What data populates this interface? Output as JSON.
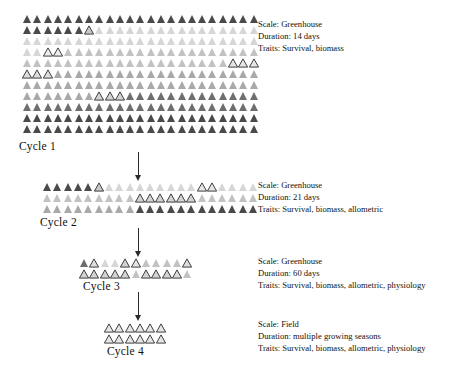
{
  "diagram": {
    "colors": {
      "shade_1": "#4a4a4a",
      "shade_2": "#6e6e6e",
      "shade_3": "#8d8d8d",
      "shade_4": "#a9a9a9",
      "shade_5": "#c2c2c2",
      "shade_6": "#d6d6d6",
      "outline": "#2b2b2b",
      "background": "#ffffff",
      "text": "#111111"
    },
    "legend_keys": [
      "Scale",
      "Duration",
      "Traits"
    ]
  },
  "cycles": [
    {
      "label": "Cycle 1",
      "info": {
        "scale": "Scale: Greenhouse",
        "duration": "Duration: 14 days",
        "traits": "Traits: Survival, biomass"
      },
      "rows": 11,
      "cols": 23,
      "grid": [
        [
          "s1",
          "s1",
          "s1",
          "s1",
          "s1",
          "s1",
          "s1",
          "s1",
          "s1",
          "s1",
          "s1",
          "s1",
          "s1",
          "s1",
          "s1",
          "s1",
          "s1",
          "s1",
          "s1",
          "s1",
          "s1",
          "s1",
          "s1"
        ],
        [
          "s1",
          "s1",
          "s1",
          "s1",
          "s1",
          "s1",
          "o1",
          "s6",
          "s6",
          "s6",
          "s6",
          "s6",
          "s6",
          "s6",
          "s6",
          "s6",
          "s6",
          "s6",
          "s6",
          "s6",
          "s6",
          "s6",
          "s6"
        ],
        [
          "s6",
          "s6",
          "s6",
          "s6",
          "s6",
          "s6",
          "s6",
          "s6",
          "s6",
          "s6",
          "s6",
          "s6",
          "s6",
          "s6",
          "s6",
          "s6",
          "s6",
          "s6",
          "s6",
          "s6",
          "s6",
          "s6",
          "s6"
        ],
        [
          "s6",
          "s6",
          "o5",
          "o5",
          "s5",
          "s5",
          "s5",
          "s5",
          "s5",
          "s5",
          "s5",
          "s5",
          "s5",
          "s5",
          "s5",
          "s5",
          "s5",
          "s5",
          "s5",
          "s5",
          "s5",
          "s5",
          "s5"
        ],
        [
          "s5",
          "s5",
          "s5",
          "s5",
          "s5",
          "s5",
          "s5",
          "s5",
          "s5",
          "s5",
          "s5",
          "s5",
          "s5",
          "s5",
          "s5",
          "s5",
          "s5",
          "s5",
          "s5",
          "s5",
          "o4",
          "o4",
          "o4"
        ],
        [
          "o3",
          "o3",
          "o3",
          "s4",
          "s4",
          "s4",
          "s4",
          "s4",
          "s4",
          "s4",
          "s4",
          "s4",
          "s4",
          "s4",
          "s4",
          "s4",
          "s4",
          "s4",
          "s4",
          "s4",
          "s4",
          "s4",
          "s4"
        ],
        [
          "s4",
          "s4",
          "s4",
          "s4",
          "s4",
          "s4",
          "s4",
          "s4",
          "s4",
          "s4",
          "s4",
          "s4",
          "s4",
          "s4",
          "s4",
          "s4",
          "s4",
          "s4",
          "s4",
          "s4",
          "s4",
          "s4",
          "s4"
        ],
        [
          "s4",
          "s4",
          "s4",
          "s4",
          "s4",
          "s4",
          "s4",
          "o2",
          "o2",
          "o2",
          "s2",
          "s2",
          "s2",
          "s2",
          "s2",
          "s2",
          "s2",
          "s2",
          "s2",
          "s2",
          "s2",
          "s2",
          "s2"
        ],
        [
          "s2",
          "s2",
          "s2",
          "s2",
          "s2",
          "s2",
          "s2",
          "s2",
          "s2",
          "s2",
          "s2",
          "s2",
          "s2",
          "s2",
          "s2",
          "s2",
          "s2",
          "s2",
          "s2",
          "s2",
          "s2",
          "s2",
          "s2"
        ],
        [
          "s1",
          "s1",
          "s1",
          "s1",
          "s1",
          "s1",
          "s1",
          "s1",
          "s1",
          "s1",
          "s1",
          "s1",
          "s1",
          "s1",
          "s1",
          "s1",
          "s1",
          "s1",
          "s1",
          "s1",
          "s1",
          "s1",
          "s1"
        ],
        [
          "s1",
          "s1",
          "s1",
          "s1",
          "s1",
          "s1",
          "s1",
          "s1",
          "s1",
          "s1",
          "s1",
          "s1",
          "s1",
          "s1",
          "s1",
          "s1",
          "s1",
          "s1",
          "s1",
          "s1",
          "s1",
          "s1",
          "s1"
        ]
      ]
    },
    {
      "label": "Cycle 2",
      "info": {
        "scale": "Scale: Greenhouse",
        "duration": "Duration: 21 days",
        "traits": "Traits: Survival, biomass, allometric"
      },
      "rows": 3,
      "cols": 21,
      "grid": [
        [
          "s1",
          "s1",
          "s1",
          "s1",
          "s1",
          "o1",
          "s6",
          "s6",
          "s6",
          "s6",
          "s6",
          "s6",
          "s6",
          "s6",
          "s6",
          "o4",
          "o4",
          "s6",
          "s6",
          "s6",
          "s6"
        ],
        [
          "s5",
          "s5",
          "s5",
          "s5",
          "s5",
          "s5",
          "s5",
          "s5",
          "s5",
          "o2",
          "o2",
          "o2",
          "o2",
          "o2",
          "o2",
          "s5",
          "s5",
          "s5",
          "s5",
          "s5",
          "s5"
        ],
        [
          "s4",
          "s4",
          "s4",
          "s4",
          "s4",
          "s4",
          "s4",
          "s4",
          "s4",
          "s1",
          "s1",
          "s1",
          "s1",
          "s1",
          "s1",
          "s1",
          "s1",
          "s1",
          "s1",
          "s1",
          "s1"
        ]
      ]
    },
    {
      "label": "Cycle 3",
      "info": {
        "scale": "Scale: Greenhouse",
        "duration": "Duration: 60 days",
        "traits": "Traits: Survival, biomass, allometric, physiology"
      },
      "rows": 2,
      "cols": 11,
      "grid": [
        [
          "s2",
          "o3",
          "s6",
          "s6",
          "o2",
          "o4",
          "s5",
          "s5",
          "s5",
          "s5",
          "o3"
        ],
        [
          "o2",
          "o2",
          "o2",
          "o2",
          "o2",
          "s5",
          "o2",
          "o2",
          "o2",
          "o3",
          "s5"
        ]
      ]
    },
    {
      "label": "Cycle 4",
      "info": {
        "scale": "Scale: Field",
        "duration": "Duration: multiple growing seasons",
        "traits": "Traits: Survival, biomass, allometric, physiology"
      },
      "rows": 2,
      "cols": 6,
      "grid": [
        [
          "o4",
          "o4",
          "o4",
          "o4",
          "o4",
          "o4"
        ],
        [
          "o4",
          "o4",
          "o4",
          "o4",
          "o4",
          "o4"
        ]
      ]
    }
  ],
  "arrows": [
    {
      "name": "arrow-cycle1-to-cycle2"
    },
    {
      "name": "arrow-cycle2-to-cycle3"
    },
    {
      "name": "arrow-cycle3-to-cycle4"
    }
  ]
}
